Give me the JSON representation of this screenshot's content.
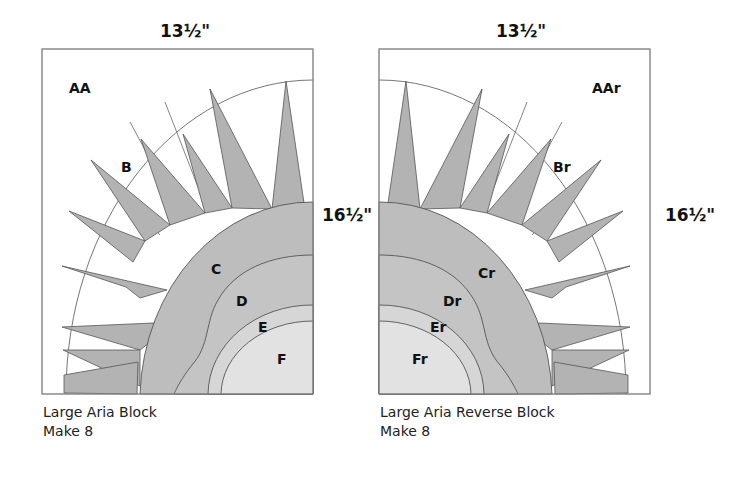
{
  "colors": {
    "frame": "#8a8a8a",
    "spike": "#b3b3b3",
    "ring_c": "#bdbdbd",
    "ring_d": "#c4c4c4",
    "ring_e": "#d6d6d6",
    "ring_f": "#e2e2e2",
    "line": "#555555"
  },
  "left_block": {
    "width_label": "13½\"",
    "height_label": "16½\"",
    "pieces": {
      "aa": "AA",
      "b": "B",
      "c": "C",
      "d": "D",
      "e": "E",
      "f": "F"
    },
    "caption_line1": "Large Aria Block",
    "caption_line2": "Make 8"
  },
  "right_block": {
    "width_label": "13½\"",
    "height_label": "16½\"",
    "pieces": {
      "aa": "AAr",
      "b": "Br",
      "c": "Cr",
      "d": "Dr",
      "e": "Er",
      "f": "Fr"
    },
    "caption_line1": "Large Aria Reverse Block",
    "caption_line2": "Make 8"
  }
}
